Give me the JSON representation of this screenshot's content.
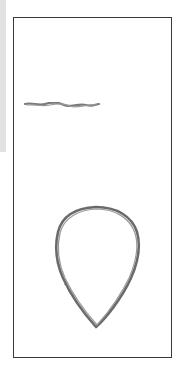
{
  "drawing": {
    "description": "Pencil sketch in a rectangular frame: a horizontal squiggly line and a teardrop shape",
    "colors": {
      "stroke": "#6b6b6b",
      "frame": "#3a3a3a",
      "background": "#ffffff",
      "edge_strip": "#e2e2e2"
    },
    "elements": [
      {
        "name": "horizontal-line",
        "kind": "line"
      },
      {
        "name": "teardrop-shape",
        "kind": "outline"
      }
    ]
  }
}
